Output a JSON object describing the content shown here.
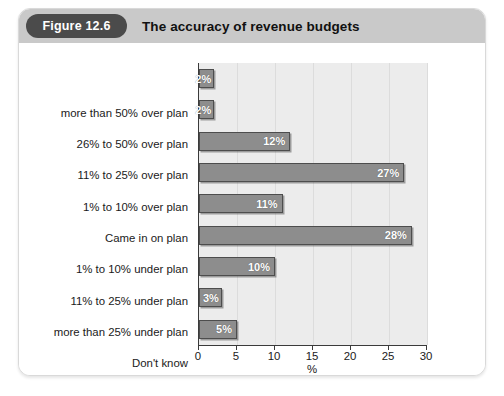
{
  "figure": {
    "badge_label": "Figure 12.6",
    "title": "The accuracy of revenue budgets"
  },
  "colors": {
    "header_bar": "#c9c9c9",
    "badge": "#4b4b4b",
    "bar_fill": "#8d8d8d",
    "bar_border": "#4d4d4d",
    "plot_background": "#ececec",
    "gridline": "#dcdcdc",
    "axis": "#3a3a3a"
  },
  "chart_data": {
    "type": "bar",
    "orientation": "horizontal",
    "title": "The accuracy of revenue budgets",
    "xlabel": "%",
    "ylabel": "",
    "xlim": [
      0,
      30
    ],
    "xticks": [
      0,
      5,
      10,
      15,
      20,
      25,
      30
    ],
    "xtick_labels": [
      "0",
      "5",
      "10",
      "15",
      "20",
      "25",
      "30"
    ],
    "grid": true,
    "legend": null,
    "categories": [
      "more than 50% over plan",
      "26% to 50% over plan",
      "11% to 25% over plan",
      "1% to 10% over plan",
      "Came in on plan",
      "1% to 10% under plan",
      "11% to 25% under plan",
      "more than 25% under plan",
      "Don't know"
    ],
    "values": [
      2,
      2,
      12,
      27,
      11,
      28,
      10,
      3,
      5
    ],
    "data_labels": [
      "2%",
      "2%",
      "12%",
      "27%",
      "11%",
      "28%",
      "10%",
      "3%",
      "5%"
    ]
  }
}
